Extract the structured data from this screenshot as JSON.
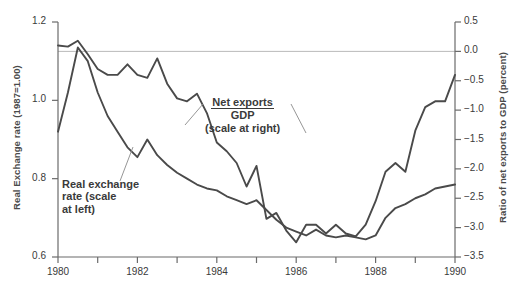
{
  "axes": {
    "left": {
      "title": "Real Exchange rate (1987=1.00)",
      "ticks": [
        "1.2",
        "1.0",
        "0.8",
        "0.6"
      ]
    },
    "right": {
      "title": "Ratio of net exports to GDP (percent)",
      "ticks": [
        "0.5",
        "0.0",
        "−0.5",
        "−1.0",
        "−1.5",
        "−2.0",
        "−2.5",
        "−3.0",
        "−3.5"
      ]
    },
    "bottom": {
      "ticks": [
        "1980",
        "1982",
        "1984",
        "1986",
        "1988",
        "1990"
      ]
    }
  },
  "annotations": {
    "exchange": {
      "line1": "Real exchange",
      "line2": "rate (scale",
      "line3": "at left)"
    },
    "netexports": {
      "numerator": "Net exports",
      "denominator": "GDP",
      "note": "(scale at right)"
    }
  },
  "chart_data": {
    "type": "line",
    "title": "",
    "xlabel": "",
    "ylabel": "Real Exchange rate (1987=1.00)",
    "y2label": "Ratio of net exports to GDP (percent)",
    "xlim": [
      1980.0,
      1990.0
    ],
    "ylim": [
      0.6,
      1.2
    ],
    "y2lim": [
      -3.5,
      0.5
    ],
    "grid": false,
    "reference_line": {
      "axis": "right",
      "value": 0.0,
      "color": "#b9b9b9"
    },
    "xticks": [
      1980,
      1981,
      1982,
      1983,
      1984,
      1985,
      1986,
      1987,
      1988,
      1989,
      1990
    ],
    "xticklabels": [
      "1980",
      "",
      "1982",
      "",
      "1984",
      "",
      "1986",
      "",
      "1988",
      "",
      "1990"
    ],
    "yticks": [
      0.6,
      0.8,
      1.0,
      1.2
    ],
    "y2ticks": [
      -3.5,
      -3.0,
      -2.5,
      -2.0,
      -1.5,
      -1.0,
      -0.5,
      0.0,
      0.5
    ],
    "legend_position": "inline-annotations",
    "line_color": "#4a4a4a",
    "series": [
      {
        "name": "Real exchange rate (scale at left)",
        "axis": "left",
        "x": [
          1980.0,
          1980.25,
          1980.5,
          1980.75,
          1981.0,
          1981.25,
          1981.5,
          1981.75,
          1982.0,
          1982.25,
          1982.5,
          1982.75,
          1983.0,
          1983.25,
          1983.5,
          1983.75,
          1984.0,
          1984.25,
          1984.5,
          1984.75,
          1985.0,
          1985.25,
          1985.5,
          1985.75,
          1986.0,
          1986.25,
          1986.5,
          1986.75,
          1987.0,
          1987.25,
          1987.5,
          1987.75,
          1988.0,
          1988.25,
          1988.5,
          1988.75,
          1989.0,
          1989.25,
          1989.5,
          1989.75,
          1990.0
        ],
        "values": [
          0.92,
          1.02,
          1.135,
          1.1,
          1.02,
          0.96,
          0.92,
          0.88,
          0.855,
          0.9,
          0.86,
          0.835,
          0.815,
          0.8,
          0.785,
          0.775,
          0.77,
          0.755,
          0.745,
          0.735,
          0.745,
          0.72,
          0.695,
          0.675,
          0.665,
          0.655,
          0.67,
          0.655,
          0.65,
          0.655,
          0.65,
          0.645,
          0.655,
          0.7,
          0.725,
          0.735,
          0.75,
          0.76,
          0.775,
          0.78,
          0.785
        ]
      },
      {
        "name": "Net exports / GDP (scale at right)",
        "axis": "right",
        "x": [
          1980.0,
          1980.25,
          1980.5,
          1980.75,
          1981.0,
          1981.25,
          1981.5,
          1981.75,
          1982.0,
          1982.25,
          1982.5,
          1982.75,
          1983.0,
          1983.25,
          1983.5,
          1983.75,
          1984.0,
          1984.25,
          1984.5,
          1984.75,
          1985.0,
          1985.25,
          1985.5,
          1985.75,
          1986.0,
          1986.25,
          1986.5,
          1986.75,
          1987.0,
          1987.25,
          1987.5,
          1987.75,
          1988.0,
          1988.25,
          1988.5,
          1988.75,
          1989.0,
          1989.25,
          1989.5,
          1989.75,
          1990.0
        ],
        "values": [
          0.1,
          0.08,
          0.18,
          -0.05,
          -0.3,
          -0.4,
          -0.4,
          -0.22,
          -0.4,
          -0.45,
          -0.12,
          -0.55,
          -0.8,
          -0.85,
          -0.72,
          -1.05,
          -1.55,
          -1.7,
          -1.9,
          -2.3,
          -1.95,
          -2.85,
          -2.75,
          -3.05,
          -3.25,
          -2.95,
          -2.95,
          -3.1,
          -2.95,
          -3.1,
          -3.15,
          -2.95,
          -2.55,
          -2.05,
          -1.9,
          -2.05,
          -1.35,
          -0.95,
          -0.85,
          -0.85,
          -0.4
        ]
      }
    ]
  }
}
